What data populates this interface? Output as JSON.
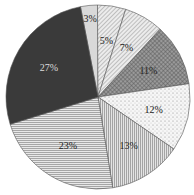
{
  "chart_data": {
    "type": "pie",
    "title": "",
    "start_angle_deg": -11,
    "direction": "clockwise",
    "slices": [
      {
        "label": "3%",
        "value": 3,
        "pattern": "solid-light",
        "fill": "#d9d9d9",
        "text_color": "#222222"
      },
      {
        "label": "5%",
        "value": 5,
        "pattern": "diag-fine",
        "fill": "#e8e8e8",
        "text_color": "#222222"
      },
      {
        "label": "7%",
        "value": 7,
        "pattern": "diag-fine",
        "fill": "#e0e0e0",
        "text_color": "#222222"
      },
      {
        "label": "11%",
        "value": 11,
        "pattern": "crosshatch",
        "fill": "#8c8c8c",
        "text_color": "#222222"
      },
      {
        "label": "12%",
        "value": 12,
        "pattern": "dots",
        "fill": "#f4f4f4",
        "text_color": "#222222"
      },
      {
        "label": "13%",
        "value": 13,
        "pattern": "vertical-lines",
        "fill": "#cfcfcf",
        "text_color": "#222222"
      },
      {
        "label": "23%",
        "value": 23,
        "pattern": "horizontal-lines",
        "fill": "#d6d6d6",
        "text_color": "#222222"
      },
      {
        "label": "27%",
        "value": 27,
        "pattern": "solid-dark",
        "fill": "#3a3a3a",
        "text_color": "#dddddd"
      }
    ],
    "legend": null
  }
}
